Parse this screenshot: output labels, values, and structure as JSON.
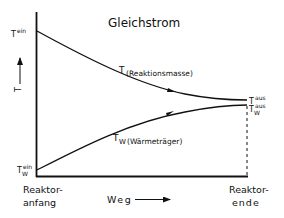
{
  "title": "Gleichstrom",
  "y_axis": {
    "label": "T",
    "arrow": "up"
  },
  "x_axis": {
    "label": "Weg",
    "arrow": "right",
    "start_label_line1": "Reaktor-",
    "start_label_line2": "anfang",
    "end_label_line1": "Reaktor-",
    "end_label_line2": "ende"
  },
  "curves": [
    {
      "name": "T (Reaktionsmasse)",
      "symbol": "T",
      "label": "(Reaktionsmasse)",
      "start_label": {
        "base": "T",
        "sup": "ein",
        "sub": ""
      },
      "end_label": {
        "base": "T",
        "sup": "aus",
        "sub": ""
      },
      "trend": "decreasing"
    },
    {
      "name": "T_W (Wärmeträger)",
      "symbol": "T",
      "subscript": "W",
      "label": "(Wärmeträger)",
      "start_label": {
        "base": "T",
        "sup": "ein",
        "sub": "W"
      },
      "end_label": {
        "base": "T",
        "sup": "aus",
        "sub": "W"
      },
      "trend": "increasing"
    }
  ],
  "colors": {
    "ink": "#111111",
    "background": "#ffffff"
  }
}
